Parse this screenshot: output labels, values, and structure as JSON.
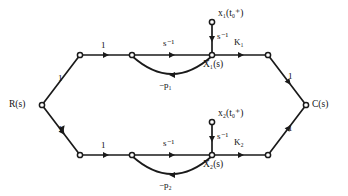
{
  "diagram": {
    "type": "signal-flow-graph",
    "stroke_color": "#1a1a1a",
    "background_color": "#ffffff",
    "node_fill_color": "#ffffff"
  },
  "nodes": [
    {
      "id": "R",
      "label": "R(s)",
      "x": 42,
      "y": 105,
      "label_side": "left"
    },
    {
      "id": "A1",
      "label": "",
      "x": 80,
      "y": 55,
      "label_side": "none"
    },
    {
      "id": "B1",
      "label": "",
      "x": 132,
      "y": 55,
      "label_side": "none"
    },
    {
      "id": "X1",
      "label": "X₁(s)",
      "x": 212,
      "y": 55,
      "label_side": "below"
    },
    {
      "id": "D1",
      "label": "",
      "x": 268,
      "y": 55,
      "label_side": "none"
    },
    {
      "id": "I1",
      "label": "x₁(t₀⁺)",
      "x": 212,
      "y": 22,
      "label_side": "right"
    },
    {
      "id": "A2",
      "label": "",
      "x": 80,
      "y": 155,
      "label_side": "none"
    },
    {
      "id": "B2",
      "label": "",
      "x": 132,
      "y": 155,
      "label_side": "none"
    },
    {
      "id": "X2",
      "label": "X₂(s)",
      "x": 212,
      "y": 155,
      "label_side": "below"
    },
    {
      "id": "D2",
      "label": "",
      "x": 268,
      "y": 155,
      "label_side": "none"
    },
    {
      "id": "I2",
      "label": "x₂(t₀⁺)",
      "x": 212,
      "y": 122,
      "label_side": "right"
    },
    {
      "id": "C",
      "label": "C(s)",
      "x": 306,
      "y": 105,
      "label_side": "right"
    }
  ],
  "branches": [
    {
      "id": "r-a1",
      "from": "R",
      "to": "A1",
      "gain": "1",
      "kind": "straight"
    },
    {
      "id": "a1-b1",
      "from": "A1",
      "to": "B1",
      "gain": "1",
      "kind": "straight"
    },
    {
      "id": "b1-x1",
      "from": "B1",
      "to": "X1",
      "gain": "s⁻¹",
      "kind": "straight"
    },
    {
      "id": "x1-d1",
      "from": "X1",
      "to": "D1",
      "gain": "K₁",
      "kind": "straight"
    },
    {
      "id": "d1-c",
      "from": "D1",
      "to": "C",
      "gain": "1",
      "kind": "straight"
    },
    {
      "id": "i1-x1",
      "from": "I1",
      "to": "X1",
      "gain": "s⁻¹",
      "kind": "straight"
    },
    {
      "id": "x1-b1",
      "from": "X1",
      "to": "B1",
      "gain": "−p₁",
      "kind": "arc"
    },
    {
      "id": "r-a2",
      "from": "R",
      "to": "A2",
      "gain": "1",
      "kind": "straight"
    },
    {
      "id": "a2-b2",
      "from": "A2",
      "to": "B2",
      "gain": "1",
      "kind": "straight"
    },
    {
      "id": "b2-x2",
      "from": "B2",
      "to": "X2",
      "gain": "s⁻¹",
      "kind": "straight"
    },
    {
      "id": "x2-d2",
      "from": "X2",
      "to": "D2",
      "gain": "K₂",
      "kind": "straight"
    },
    {
      "id": "d2-c",
      "from": "D2",
      "to": "C",
      "gain": "1",
      "kind": "straight"
    },
    {
      "id": "i2-x2",
      "from": "I2",
      "to": "X2",
      "gain": "s⁻¹",
      "kind": "straight"
    },
    {
      "id": "x2-b2",
      "from": "X2",
      "to": "B2",
      "gain": "−p₂",
      "kind": "arc"
    }
  ],
  "labels": {
    "source": "R(s)",
    "sink": "C(s)",
    "state_1": "X₁(s)",
    "state_2": "X₂(s)",
    "initial_condition_1": "x₁(t₀⁺)",
    "initial_condition_2": "x₂(t₀⁺)",
    "integrator_gain": "s⁻¹",
    "forward_gain_1": "K₁",
    "forward_gain_2": "K₂",
    "feedback_gain_1": "−p₁",
    "feedback_gain_2": "−p₂",
    "unity_gain": "1"
  }
}
